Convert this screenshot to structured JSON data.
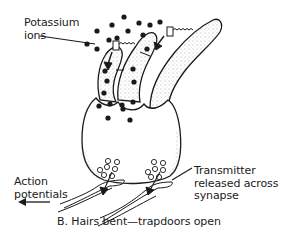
{
  "figure": {
    "caption": "B. Hairs bent—trapdoors open",
    "labels": {
      "potassium_line1": "Potassium",
      "potassium_line2": "ions",
      "action_line1": "Action",
      "action_line2": "potentials",
      "transmitter_line1": "Transmitter",
      "transmitter_line2": "released across",
      "transmitter_line3": "synapse"
    },
    "colors": {
      "ink": "#1a1a1a",
      "background": "#ffffff"
    }
  }
}
